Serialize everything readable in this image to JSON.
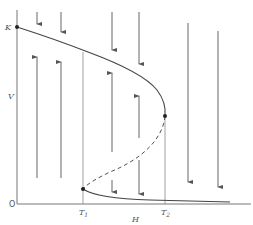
{
  "figure": {
    "type": "phase-plane bifurcation diagram",
    "header_faint_text": "",
    "axes": {
      "x_label": "H",
      "y_label": "V",
      "origin_label": "O",
      "y_marker_label": "K",
      "x_tick_1": {
        "letter": "T",
        "sub": "1"
      },
      "x_tick_2": {
        "letter": "T",
        "sub": "2"
      }
    },
    "curve": {
      "upper_stable_branch": "solid curve from K to turning point at T2",
      "middle_unstable_branch": "dashed curve from T2 turning point down to T1",
      "lower_stable_branch": "solid curve from T1 approaching H-axis"
    },
    "points": [
      {
        "name": "K",
        "location": "top of V axis, start of upper branch"
      },
      {
        "name": "upper-turning-point",
        "location": "at H = T2"
      },
      {
        "name": "lower-turning-point",
        "location": "at H = T1"
      }
    ],
    "flow_arrows_description": "vertical arrows point toward stable branches: downward above upper branch, upward between branches, downward toward lower branch",
    "colors": {
      "ink": "#444444",
      "background": "#ffffff"
    }
  }
}
